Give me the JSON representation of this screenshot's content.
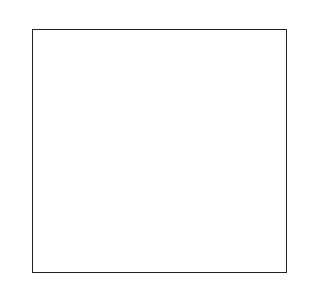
{
  "colors": {
    "white": "#ffffff",
    "gray": "#a8a8a8",
    "dark": "#2a2a2a",
    "gridline": "#9a9a9a",
    "border": "#222222"
  },
  "grid": {
    "columns": 30,
    "rows_count": 28,
    "legend": {
      ".": "white",
      "g": "gray",
      "d": "dark"
    },
    "rows": [
      ".......g..............d.......",
      ".......gg............dd.......",
      ".......ggg..........ddd.......",
      ".......gggg........dddd.......",
      ".......ggggg......ddddd.......",
      ".......gggggg...ddddddd.......",
      "dddddddgggggggdddddddddggggggg",
      ".dddddddgggggggdddddddggggggg.",
      "..dddddddggggggddddddggggggg..",
      "...dddddddgggggdddddggggggg...",
      "....dddddddggggddddggggggg....",
      ".....dddddddgggdddggggggg.....",
      "......dddddddggddggggggg......",
      ".......dddddddgdggggggg.......",
      ".......gggggggdgddddddd.......",
      "......gggggggddggddddddd......",
      ".....gggggggdddgggddddddd.....",
      "....gggggggddddggggddddddd....",
      "...gggggggdddddgggggddddddd...",
      "..gggggggddddddggggggddddddd..",
      ".gggggggdddddddgggggggddddddd.",
      "gggggggdddddddddgggggggddddddd",
      ".......ddddddd...gggggg.......",
      ".......ddddd......ggggg.......",
      ".......dddd........gggg.......",
      ".......ddd..........ggg.......",
      ".......dd............gg.......",
      ".......d..............g......."
    ]
  },
  "left_labels": [
    "28",
    "26",
    "24",
    "22",
    "20",
    "18",
    "16",
    "14",
    "12",
    "10",
    "8",
    "6",
    "4",
    "2"
  ],
  "right_labels": [
    "27",
    "25",
    "23",
    "21",
    "19",
    "17",
    "15",
    "13",
    "11",
    "9",
    "7",
    "5",
    "3",
    "1"
  ]
}
